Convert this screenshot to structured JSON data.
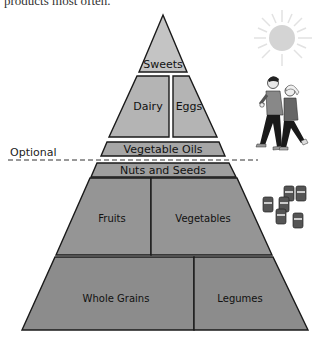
{
  "caption": "products most often.",
  "optional_label": "Optional",
  "tiers": {
    "sweets": "Sweets",
    "dairy": "Dairy",
    "eggs": "Eggs",
    "vegetable_oils": "Vegetable Oils",
    "nuts_seeds": "Nuts and Seeds",
    "fruits": "Fruits",
    "vegetables": "Vegetables",
    "whole_grains": "Whole Grains",
    "legumes": "Legumes"
  },
  "icons": [
    "sun-icon",
    "joggers-illustration",
    "supplement-bottles-icon"
  ],
  "colors": {
    "top_tier": "#c4c4c4",
    "middle_tier": "#a6a6a6",
    "bottom_tier": "#8c8c8c",
    "outline": "#1a1a1a"
  }
}
